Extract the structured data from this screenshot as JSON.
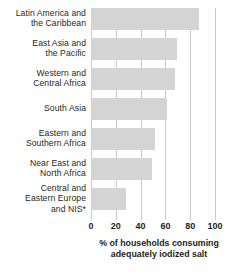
{
  "chart_data": {
    "type": "bar",
    "orientation": "horizontal",
    "title": "",
    "xlabel_lines": [
      "% of households consuming",
      "adequately iodized salt"
    ],
    "xlabel": "% of households consuming adequately iodized salt",
    "ylabel": "",
    "categories": [
      "Latin America and the Caribbean",
      "East Asia and the Pacific",
      "Western and Central Africa",
      "South Asia",
      "Eastern and Southern Africa",
      "Near East and North Africa",
      "Central and Eastern Europe and NIS*"
    ],
    "category_lines": [
      [
        "Latin America and",
        "the Caribbean"
      ],
      [
        "East Asia and",
        "the Pacific"
      ],
      [
        "Western and",
        "Central Africa"
      ],
      [
        "South Asia"
      ],
      [
        "Eastern and",
        "Southern Africa"
      ],
      [
        "Near East and",
        "North Africa"
      ],
      [
        "Central and",
        "Eastern Europe",
        "and NIS*"
      ]
    ],
    "values": [
      87,
      69,
      68,
      61,
      52,
      49,
      28
    ],
    "xlim": [
      0,
      100
    ],
    "xticks": [
      0,
      20,
      40,
      60,
      80,
      100
    ],
    "xtick_labels": [
      "0",
      "20",
      "40",
      "60",
      "80",
      "100"
    ],
    "grid": true,
    "grid_axis": "x",
    "legend": false,
    "colors": {
      "bar_fill": "#d4d4d4",
      "gridline": "#c9c9c9",
      "text": "#231f20",
      "background": "#ffffff"
    }
  }
}
